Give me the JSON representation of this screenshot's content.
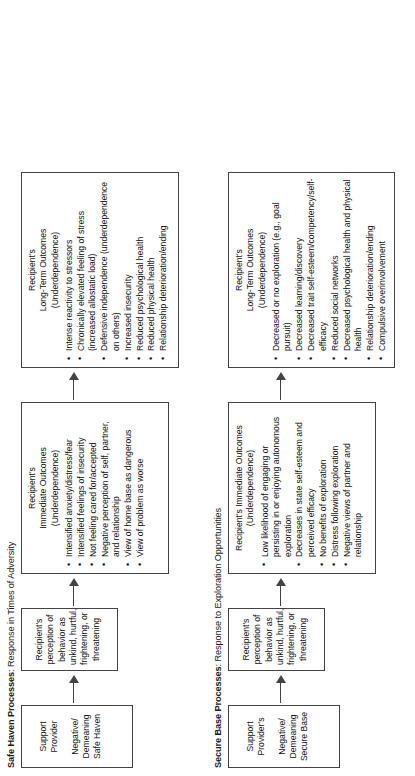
{
  "diagram": {
    "type": "flowchart",
    "orientation": "rotated-90-ccw",
    "rows": [
      {
        "title_strong": "Safe Haven Processes",
        "title_rest": ": Response in Times of Adversity",
        "boxes": {
          "provider": {
            "line1": "Support",
            "line2": "Provider",
            "line3": "Negative/",
            "line4": "Demeaning",
            "line5": "Safe Haven"
          },
          "perception": {
            "line1": "Recipient's",
            "line2": "perception of",
            "line3": "behavior as",
            "line4": "unkind, hurtful,",
            "line5": "frightening, or",
            "line6": "threatening"
          },
          "immediate": {
            "head1": "Recipient's",
            "head2": "Immediate Outcomes",
            "head3": "(Underdependence)",
            "bullets": [
              "Intensified anxiety/distress/fear",
              "Intensified feelings of insecurity",
              "Not feeling cared for/accepted",
              "Negative perception of self, partner, and relationship",
              "View of home base as dangerous",
              "View of problem as worse"
            ]
          },
          "longterm": {
            "head1": "Recipient's",
            "head2": "Long-Term Outcomes",
            "head3": "(Underdependence)",
            "bullets": [
              "Intense reactivity to stressors",
              "Chronically elevated feeling of stress (increased allostatic load)",
              "Defensive independence (underdependence on others)",
              "Increased insecurity",
              "Reduced psychological health",
              "Reduced physical health",
              "Relationship deterioration/ending"
            ]
          }
        }
      },
      {
        "title_strong": "Secure Base Processes",
        "title_rest": ": Response to Exploration Opportunities",
        "boxes": {
          "provider": {
            "line1": "Support",
            "line2": "Provider's",
            "line3": "Negative/",
            "line4": "Demeaning",
            "line5": "Secure Base"
          },
          "perception": {
            "line1": "Recipient's",
            "line2": "perception of",
            "line3": "behavior as",
            "line4": "unkind, hurtful,",
            "line5": "frightening, or",
            "line6": "threatening"
          },
          "immediate": {
            "head1": "Recipient's Immediate Outcomes",
            "head2": "(Underdependence)",
            "head3": "",
            "bullets": [
              "Low likelihood of engaging or persisting in or enjoying autonomous exploration",
              "Decreases in state self-esteem and perceived efficacy",
              "No benefits of exploration",
              "Distress following exploration",
              "Negative views of partner and relationship"
            ]
          },
          "longterm": {
            "head1": "Recipient's",
            "head2": "Long-Term Outcomes",
            "head3": "(Underdependence)",
            "bullets": [
              "Decreased or no exploration (e.g., goal pursuit)",
              "Decreased learning/discovery",
              "Decreased trait self-esteem/competency/self-efficacy",
              "Reduced social networks",
              "Decreased psychological health and physical health",
              "Relationship deterioration/ending",
              "Compulsive overinvolvement"
            ]
          }
        }
      }
    ]
  }
}
